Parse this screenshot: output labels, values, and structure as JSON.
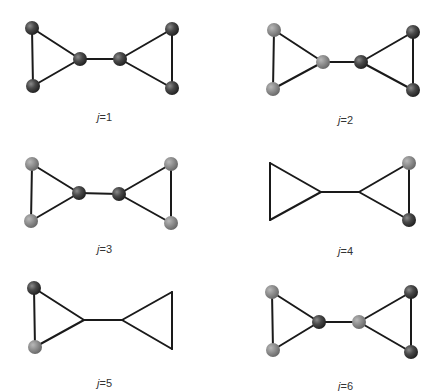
{
  "figure": {
    "colors": {
      "dark": "#404040",
      "light": "#8c8c8c",
      "edge": "#1a1a1a"
    },
    "panels": [
      {
        "label_var": "j",
        "label_eq": "=1",
        "label_pos": [
          97,
          121
        ],
        "nodes": [
          {
            "id": "a",
            "x": 32,
            "y": 28,
            "color": "dark"
          },
          {
            "id": "b",
            "x": 33,
            "y": 86,
            "color": "dark"
          },
          {
            "id": "c",
            "x": 80,
            "y": 59,
            "color": "dark"
          },
          {
            "id": "d",
            "x": 120,
            "y": 59,
            "color": "dark"
          },
          {
            "id": "e",
            "x": 172,
            "y": 29,
            "color": "dark"
          },
          {
            "id": "f",
            "x": 172,
            "y": 88,
            "color": "dark"
          }
        ]
      },
      {
        "label_var": "j",
        "label_eq": "=2",
        "label_pos": [
          338,
          124
        ],
        "nodes": [
          {
            "id": "a",
            "x": 274,
            "y": 30,
            "color": "light"
          },
          {
            "id": "b",
            "x": 273,
            "y": 89,
            "color": "light"
          },
          {
            "id": "c",
            "x": 323,
            "y": 62,
            "color": "light"
          },
          {
            "id": "d",
            "x": 361,
            "y": 62,
            "color": "dark"
          },
          {
            "id": "e",
            "x": 413,
            "y": 32,
            "color": "dark"
          },
          {
            "id": "f",
            "x": 413,
            "y": 90,
            "color": "dark"
          }
        ]
      },
      {
        "label_var": "j",
        "label_eq": "=3",
        "label_pos": [
          97,
          253
        ],
        "nodes": [
          {
            "id": "a",
            "x": 32,
            "y": 164,
            "color": "light"
          },
          {
            "id": "b",
            "x": 31,
            "y": 221,
            "color": "light"
          },
          {
            "id": "c",
            "x": 79,
            "y": 193,
            "color": "dark"
          },
          {
            "id": "d",
            "x": 119,
            "y": 194,
            "color": "dark"
          },
          {
            "id": "e",
            "x": 171,
            "y": 164,
            "color": "light"
          },
          {
            "id": "f",
            "x": 171,
            "y": 223,
            "color": "light"
          }
        ]
      },
      {
        "label_var": "j",
        "label_eq": "=4",
        "label_pos": [
          338,
          255
        ],
        "nodes": [
          {
            "id": "a",
            "x": 270,
            "y": 163,
            "color": "none"
          },
          {
            "id": "b",
            "x": 270,
            "y": 220,
            "color": "none"
          },
          {
            "id": "c",
            "x": 321,
            "y": 192,
            "color": "none"
          },
          {
            "id": "d",
            "x": 359,
            "y": 192,
            "color": "none"
          },
          {
            "id": "e",
            "x": 409,
            "y": 163,
            "color": "light"
          },
          {
            "id": "f",
            "x": 409,
            "y": 220,
            "color": "dark"
          }
        ]
      },
      {
        "label_var": "j",
        "label_eq": "=5",
        "label_pos": [
          97,
          387
        ],
        "nodes": [
          {
            "id": "a",
            "x": 34,
            "y": 288,
            "color": "dark"
          },
          {
            "id": "b",
            "x": 35,
            "y": 347,
            "color": "light"
          },
          {
            "id": "c",
            "x": 84,
            "y": 320,
            "color": "none"
          },
          {
            "id": "d",
            "x": 122,
            "y": 320,
            "color": "none"
          },
          {
            "id": "e",
            "x": 172,
            "y": 292,
            "color": "none"
          },
          {
            "id": "f",
            "x": 172,
            "y": 349,
            "color": "none"
          }
        ]
      },
      {
        "label_var": "j",
        "label_eq": "=6",
        "label_pos": [
          338,
          390
        ],
        "nodes": [
          {
            "id": "a",
            "x": 272,
            "y": 292,
            "color": "light"
          },
          {
            "id": "b",
            "x": 273,
            "y": 350,
            "color": "light"
          },
          {
            "id": "c",
            "x": 319,
            "y": 322,
            "color": "dark"
          },
          {
            "id": "d",
            "x": 359,
            "y": 322,
            "color": "light"
          },
          {
            "id": "e",
            "x": 411,
            "y": 292,
            "color": "dark"
          },
          {
            "id": "f",
            "x": 411,
            "y": 352,
            "color": "dark"
          }
        ]
      }
    ],
    "edges": [
      [
        "a",
        "b"
      ],
      [
        "a",
        "c"
      ],
      [
        "b",
        "c"
      ],
      [
        "c",
        "d"
      ],
      [
        "d",
        "e"
      ],
      [
        "d",
        "f"
      ],
      [
        "e",
        "f"
      ]
    ]
  }
}
